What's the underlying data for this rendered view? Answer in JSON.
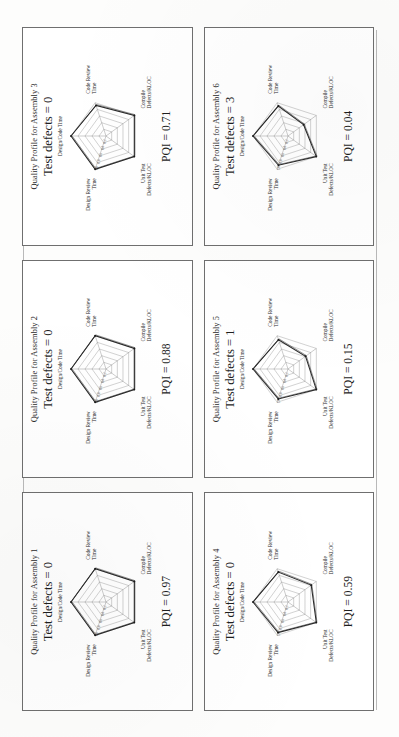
{
  "document": {
    "kind": "scanned-figure-page",
    "orientation": "rotated-90-ccw",
    "page_background": "#fdfdfc",
    "panel_border_color": "#6f6f6f"
  },
  "panels": [
    {
      "title": "Quality Profile for Assembly 1",
      "subtitle": "Test defects = 0",
      "pqi_label": "PQI = 0.97"
    },
    {
      "title": "Quality Profile for Assembly 2",
      "subtitle": "Test defects = 0",
      "pqi_label": "PQI = 0.88"
    },
    {
      "title": "Quality Profile for Assembly 3",
      "subtitle": "Test defects = 0",
      "pqi_label": "PQI = 0.71"
    },
    {
      "title": "Quality Profile for Assembly 4",
      "subtitle": "Test defects = 0",
      "pqi_label": "PQI = 0.59"
    },
    {
      "title": "Quality Profile for Assembly 5",
      "subtitle": "Test defects = 1",
      "pqi_label": "PQI = 0.15"
    },
    {
      "title": "Quality Profile for Assembly 6",
      "subtitle": "Test defects = 3",
      "pqi_label": "PQI = 0.04"
    }
  ],
  "chart_data": [
    {
      "type": "radar",
      "title": "Quality Profile for Assembly 1",
      "subtitle": "Test defects = 0",
      "categories": [
        "Design/Code Time",
        "Code Review Time",
        "Compile Defects/KLOC",
        "Unit Test Defects/KLOC",
        "Design Review Time"
      ],
      "tick_labels": [
        "0.2",
        "0.4",
        "0.6",
        "0.8",
        "1.0"
      ],
      "rlim": [
        0,
        1
      ],
      "grid": true,
      "legend": "none",
      "values": [
        1.0,
        1.0,
        1.0,
        1.0,
        1.0
      ],
      "annotation": "PQI = 0.97"
    },
    {
      "type": "radar",
      "title": "Quality Profile for Assembly 2",
      "subtitle": "Test defects = 0",
      "categories": [
        "Design/Code Time",
        "Code Review Time",
        "Compile Defects/KLOC",
        "Unit Test Defects/KLOC",
        "Design Review Time"
      ],
      "tick_labels": [
        "0.2",
        "0.4",
        "0.6",
        "0.8",
        "1.0"
      ],
      "rlim": [
        0,
        1
      ],
      "grid": true,
      "legend": "none",
      "values": [
        1.0,
        1.0,
        1.0,
        1.0,
        1.0
      ],
      "annotation": "PQI = 0.88"
    },
    {
      "type": "radar",
      "title": "Quality Profile for Assembly 3",
      "subtitle": "Test defects = 0",
      "categories": [
        "Design/Code Time",
        "Code Review Time",
        "Compile Defects/KLOC",
        "Unit Test Defects/KLOC",
        "Design Review Time"
      ],
      "tick_labels": [
        "0.2",
        "0.4",
        "0.6",
        "0.8",
        "1.0"
      ],
      "rlim": [
        0,
        1
      ],
      "grid": true,
      "legend": "none",
      "values": [
        1.0,
        0.92,
        1.0,
        1.0,
        1.0
      ],
      "annotation": "PQI = 0.71"
    },
    {
      "type": "radar",
      "title": "Quality Profile for Assembly 4",
      "subtitle": "Test defects = 0",
      "categories": [
        "Design/Code Time",
        "Code Review Time",
        "Compile Defects/KLOC",
        "Unit Test Defects/KLOC",
        "Design Review Time"
      ],
      "tick_labels": [
        "0.2",
        "0.4",
        "0.6",
        "0.8",
        "1.0"
      ],
      "rlim": [
        0,
        1
      ],
      "grid": true,
      "legend": "none",
      "values": [
        1.0,
        0.9,
        0.82,
        1.0,
        0.92
      ],
      "annotation": "PQI = 0.59"
    },
    {
      "type": "radar",
      "title": "Quality Profile for Assembly 5",
      "subtitle": "Test defects = 1",
      "categories": [
        "Design/Code Time",
        "Code Review Time",
        "Compile Defects/KLOC",
        "Unit Test Defects/KLOC",
        "Design Review Time"
      ],
      "tick_labels": [
        "0.2",
        "0.4",
        "0.6",
        "0.8",
        "1.0"
      ],
      "rlim": [
        0,
        1
      ],
      "grid": true,
      "legend": "none",
      "values": [
        1.0,
        0.88,
        0.62,
        1.0,
        0.9
      ],
      "annotation": "PQI = 0.15"
    },
    {
      "type": "radar",
      "title": "Quality Profile for Assembly 6",
      "subtitle": "Test defects = 3",
      "categories": [
        "Design/Code Time",
        "Code Review Time",
        "Compile Defects/KLOC",
        "Unit Test Defects/KLOC",
        "Design Review Time"
      ],
      "tick_labels": [
        "0.2",
        "0.4",
        "0.6",
        "0.8",
        "1.0"
      ],
      "rlim": [
        0,
        1
      ],
      "grid": true,
      "legend": "none",
      "values": [
        1.0,
        0.9,
        0.55,
        1.0,
        0.88
      ],
      "annotation": "PQI = 0.04"
    }
  ]
}
